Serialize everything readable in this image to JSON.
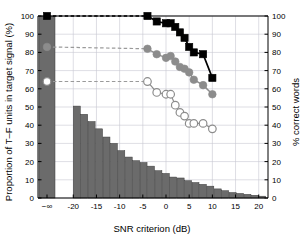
{
  "figure": {
    "background": "#ffffff",
    "plot_bg": "#ffffff",
    "grid_color": "#c8c8d2",
    "bar_color": "#6b6b6b",
    "black_series_color": "#000000",
    "gray_series_color": "#8c8c8c",
    "open_series_color": "#ffffff"
  },
  "chart_data": {
    "type": "bar",
    "title": "",
    "xlabel": "SNR criterion (dB)",
    "ylabel": "Proportion of T–F units in target signal (%)",
    "ylabel_right": "% correct words",
    "xlim": [
      -24,
      22
    ],
    "ylim": [
      0,
      100
    ],
    "ylim_right": [
      0,
      100
    ],
    "grid": true,
    "legend_position": "none",
    "xticks": [
      -20,
      -15,
      -10,
      -5,
      0,
      5,
      10,
      15,
      20
    ],
    "xticklabels": [
      "-20",
      "-15",
      "-10",
      "-5",
      "0",
      "5",
      "10",
      "15",
      "20"
    ],
    "x_break_tick": "−∞",
    "yticks": [
      0,
      10,
      20,
      30,
      40,
      50,
      60,
      70,
      80,
      90,
      100
    ],
    "yticklabels": [
      "0",
      "10",
      "20",
      "30",
      "40",
      "50",
      "60",
      "70",
      "80",
      "90",
      "100"
    ],
    "yticks_right": [
      0,
      10,
      20,
      30,
      40,
      50,
      60,
      70,
      80,
      90,
      100
    ],
    "yticklabels_right": [
      "0",
      "10",
      "20",
      "30",
      "40",
      "50",
      "60",
      "70",
      "80",
      "90",
      "100"
    ],
    "histogram": {
      "name": "Proportion of T-F units in target signal",
      "axis": "left",
      "bar_at_neg_inf": {
        "x": -22.4,
        "value": 100.0
      },
      "x": [
        -20,
        -18.4,
        -16.8,
        -15.2,
        -13.6,
        -12,
        -10.4,
        -8.8,
        -7.2,
        -5.6,
        -4,
        -2.4,
        -0.8,
        0.8,
        2.4,
        4,
        5.6,
        7.2,
        8.8,
        10.4,
        12,
        13.6,
        15.2,
        16.8,
        18.4,
        20
      ],
      "values": [
        50.5,
        46.0,
        42.0,
        38.0,
        33.5,
        30.0,
        26.0,
        22.5,
        20.5,
        19.5,
        17.5,
        15.0,
        13.5,
        11.5,
        11.0,
        9.5,
        8.5,
        7.5,
        6.5,
        5.0,
        4.0,
        3.0,
        2.5,
        2.0,
        1.5,
        1.0
      ]
    },
    "series": [
      {
        "name": "black-filled-squares",
        "marker": "filled-square",
        "color": "#000000",
        "axis": "right",
        "neg_inf_value": 100.0,
        "dashed_connector": true,
        "x": [
          -4,
          -2,
          0,
          1,
          2,
          3,
          4,
          5,
          6,
          8,
          10
        ],
        "values": [
          100.0,
          97.0,
          96.0,
          96.0,
          94.0,
          91.0,
          88.0,
          83.0,
          80.0,
          79.0,
          66.0
        ]
      },
      {
        "name": "gray-filled-circles",
        "marker": "filled-circle",
        "color": "#8c8c8c",
        "axis": "right",
        "neg_inf_value": 83.0,
        "dashed_connector": true,
        "x": [
          -4,
          -2,
          0,
          1,
          2,
          3,
          4,
          5,
          6,
          8,
          10
        ],
        "values": [
          82.0,
          79.0,
          77.0,
          78.0,
          75.0,
          72.0,
          71.0,
          69.0,
          65.0,
          62.0,
          57.0
        ]
      },
      {
        "name": "open-circles",
        "marker": "open-circle",
        "color": "#ffffff",
        "axis": "right",
        "neg_inf_value": 64.0,
        "dashed_connector": true,
        "x": [
          -4,
          -2,
          0,
          1,
          2,
          3,
          4,
          5,
          6,
          8,
          10
        ],
        "values": [
          64.0,
          58.0,
          57.0,
          57.0,
          51.0,
          47.0,
          45.0,
          41.0,
          41.0,
          41.0,
          38.0
        ]
      }
    ]
  }
}
